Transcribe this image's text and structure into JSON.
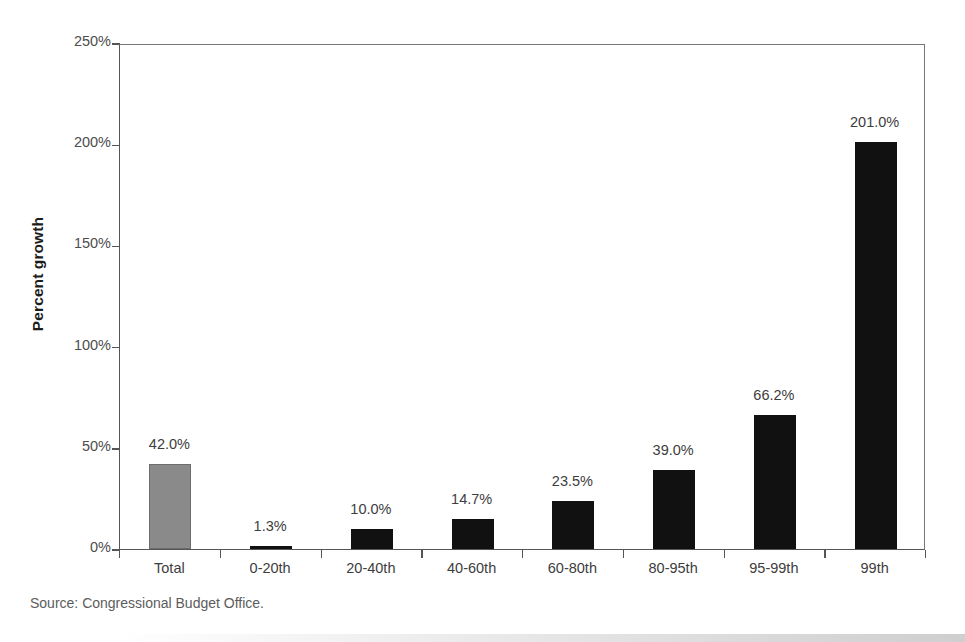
{
  "chart_data": {
    "type": "bar",
    "title": "",
    "xlabel": "",
    "ylabel": "Percent growth",
    "ylim": [
      0,
      250
    ],
    "yticks": [
      0,
      50,
      100,
      150,
      200,
      250
    ],
    "ytick_labels": [
      "0%",
      "50%",
      "100%",
      "150%",
      "200%",
      "250%"
    ],
    "grid": false,
    "legend": null,
    "categories": [
      "Total",
      "0-20th",
      "20-40th",
      "40-60th",
      "60-80th",
      "80-95th",
      "95-99th",
      "99th"
    ],
    "values": [
      42.0,
      1.3,
      10.0,
      14.7,
      23.5,
      39.0,
      66.2,
      201.0
    ],
    "data_labels": [
      "42.0%",
      "1.3%",
      "10.0%",
      "14.7%",
      "23.5%",
      "39.0%",
      "66.2%",
      "201.0%"
    ],
    "bar_colors": [
      "#8a8a8a",
      "#111111",
      "#111111",
      "#111111",
      "#111111",
      "#111111",
      "#111111",
      "#111111"
    ],
    "source": "Source: Congressional Budget Office."
  },
  "axis": {
    "y_title": "Percent growth"
  },
  "footer": {
    "source": "Source: Congressional Budget Office."
  }
}
